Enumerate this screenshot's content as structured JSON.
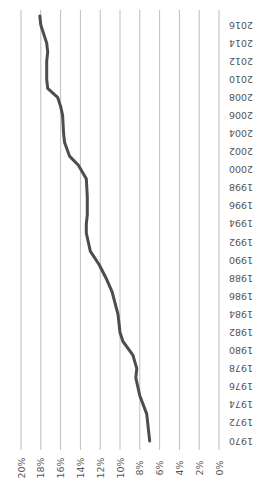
{
  "chart_data": {
    "type": "line",
    "title": "",
    "xlabel": "",
    "ylabel": "",
    "orientation": "rotated-90",
    "x_ticks": [
      "1970",
      "1972",
      "1974",
      "1976",
      "1978",
      "1980",
      "1982",
      "1984",
      "1986",
      "1988",
      "1990",
      "1992",
      "1994",
      "1996",
      "1998",
      "2000",
      "2002",
      "2004",
      "2006",
      "2008",
      "2010",
      "2012",
      "2014",
      "2016"
    ],
    "y_ticks": [
      "0%",
      "2%",
      "4%",
      "6%",
      "8%",
      "10%",
      "12%",
      "14%",
      "16%",
      "18%",
      "20%"
    ],
    "xlim": [
      1970,
      2017
    ],
    "ylim": [
      0,
      20
    ],
    "grid": true,
    "legend": null,
    "series": [
      {
        "name": "Series 1",
        "color": "#4d4d4d",
        "x": [
          1970,
          1972,
          1973,
          1975,
          1977,
          1978,
          1979.5,
          1981,
          1982,
          1984,
          1986.5,
          1988,
          1989.5,
          1991,
          1993,
          1994,
          1995,
          1997,
          1999,
          2000.5,
          2001.5,
          2003,
          2004,
          2006,
          2007,
          2008,
          2009,
          2010,
          2012,
          2013,
          2014,
          2016,
          2017
        ],
        "values": [
          7.0,
          7.2,
          7.3,
          8.0,
          8.4,
          8.3,
          8.7,
          9.7,
          10.0,
          10.2,
          10.8,
          11.4,
          12.1,
          13.0,
          13.4,
          13.4,
          13.3,
          13.3,
          13.4,
          14.2,
          15.1,
          15.6,
          15.7,
          15.8,
          16.0,
          16.3,
          17.3,
          17.4,
          17.4,
          17.3,
          17.4,
          18.0,
          18.1
        ]
      }
    ]
  }
}
